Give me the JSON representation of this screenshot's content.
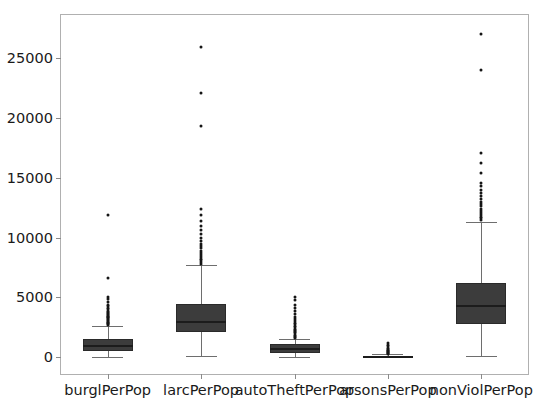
{
  "figure": {
    "background_color": "#ffffff",
    "axes_border_color": "#b0b0b0",
    "box_fill_color": "#3c3c3c",
    "box_edge_color": "#2a2a2a",
    "median_color": "#1c1c1c",
    "whisker_color": "#6e6e6e",
    "flier_color": "#151515"
  },
  "chart_data": {
    "type": "box",
    "title": "",
    "xlabel": "",
    "ylabel": "",
    "ylim": [
      -1400,
      28600
    ],
    "yticks": [
      0,
      5000,
      10000,
      15000,
      20000,
      25000
    ],
    "ytick_labels": [
      "0",
      "5000",
      "10000",
      "15000",
      "20000",
      "25000"
    ],
    "grid": false,
    "legend": null,
    "categories": [
      "burglPerPop",
      "larcPerPop",
      "autoTheftPerPop",
      "arsonsPerPop",
      "nonViolPerPop"
    ],
    "boxes": [
      {
        "label": "burglPerPop",
        "whisker_low": 30,
        "q1": 550,
        "median": 900,
        "q3": 1550,
        "whisker_high": 2600,
        "fliers": [
          2700,
          2780,
          2850,
          2900,
          2980,
          3050,
          3120,
          3200,
          3260,
          3340,
          3400,
          3480,
          3550,
          3640,
          3720,
          3800,
          3900,
          4000,
          4100,
          4250,
          4400,
          4600,
          4850,
          5000,
          6600,
          11900
        ]
      },
      {
        "label": "larcPerPop",
        "whisker_low": 90,
        "q1": 2150,
        "median": 2950,
        "q3": 4450,
        "whisker_high": 7700,
        "fliers": [
          7800,
          7950,
          8100,
          8250,
          8400,
          8550,
          8700,
          8900,
          9100,
          9300,
          9500,
          9750,
          10000,
          10300,
          10600,
          11000,
          11400,
          11900,
          12400,
          19300,
          22100,
          25900
        ]
      },
      {
        "label": "autoTheftPerPop",
        "whisker_low": 10,
        "q1": 350,
        "median": 700,
        "q3": 1100,
        "whisker_high": 1500,
        "fliers": [
          1600,
          1700,
          1800,
          1900,
          2000,
          2100,
          2200,
          2300,
          2400,
          2500,
          2600,
          2750,
          2900,
          3050,
          3200,
          3400,
          3600,
          3850,
          4100,
          4400,
          4750,
          5000
        ]
      },
      {
        "label": "arsonsPerPop",
        "whisker_low": 0,
        "q1": 20,
        "median": 55,
        "q3": 110,
        "whisker_high": 230,
        "fliers": [
          280,
          330,
          380,
          430,
          490,
          550,
          620,
          700,
          800,
          900,
          1050,
          1200
        ]
      },
      {
        "label": "nonViolPerPop",
        "whisker_low": 130,
        "q1": 2780,
        "median": 4250,
        "q3": 6200,
        "whisker_high": 11300,
        "fliers": [
          11450,
          11600,
          11750,
          11900,
          12050,
          12200,
          12400,
          12600,
          12800,
          13000,
          13250,
          13500,
          13750,
          14000,
          14300,
          14600,
          15400,
          16200,
          17100,
          24000,
          27000
        ]
      }
    ]
  }
}
